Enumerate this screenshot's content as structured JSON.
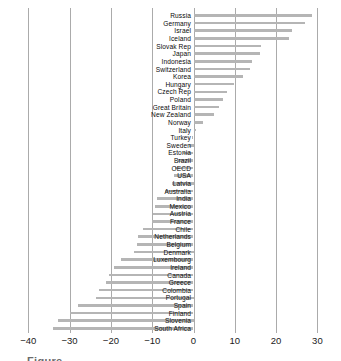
{
  "chart_data": {
    "type": "bar",
    "orientation": "horizontal",
    "title": "",
    "xlabel": "",
    "ylabel": "",
    "xlim": [
      -45,
      33
    ],
    "grid": true,
    "bar_color": "#b5b5b5",
    "gridline_color": "#ababab",
    "x_ticks": [
      -40,
      -30,
      -20,
      -10,
      0,
      10,
      20,
      30
    ],
    "x_tick_labels": [
      "−40",
      "−30",
      "−20",
      "−10",
      "0",
      "10",
      "20",
      "30"
    ],
    "categories": [
      "Russia",
      "Germany",
      "Israel",
      "Iceland",
      "Slovak Rep",
      "Japan",
      "Indonesia",
      "Switzerland",
      "Korea",
      "Hungary",
      "Czech Rep",
      "Poland",
      "Great Britain",
      "New Zealand",
      "Norway",
      "Italy",
      "Turkey",
      "Sweden",
      "Estonia",
      "Brazil",
      "OECD",
      "USA",
      "Latvia",
      "Australia",
      "India",
      "Mexico",
      "Austria",
      "France",
      "Chile",
      "Netherlands",
      "Belgium",
      "Denmark",
      "Luxembourg",
      "Ireland",
      "Canada",
      "Greece",
      "Colombia",
      "Portugal",
      "Spain",
      "Finland",
      "Slovenia",
      "South Africa"
    ],
    "values": [
      28.6,
      26.9,
      23.8,
      23.2,
      16.4,
      16.0,
      14.1,
      13.6,
      11.9,
      9.7,
      8.0,
      7.2,
      6.1,
      5.0,
      2.4,
      0.5,
      -0.3,
      -1.2,
      -2.6,
      -3.8,
      -4.5,
      -4.8,
      -5.2,
      -7.0,
      -8.8,
      -9.3,
      -9.7,
      -10.1,
      -12.2,
      -13.4,
      -13.7,
      -14.4,
      -17.6,
      -19.3,
      -20.5,
      -21.2,
      -22.8,
      -23.6,
      -27.9,
      -30.0,
      -32.8,
      -34.0
    ]
  },
  "caption_fragment": "Figure"
}
